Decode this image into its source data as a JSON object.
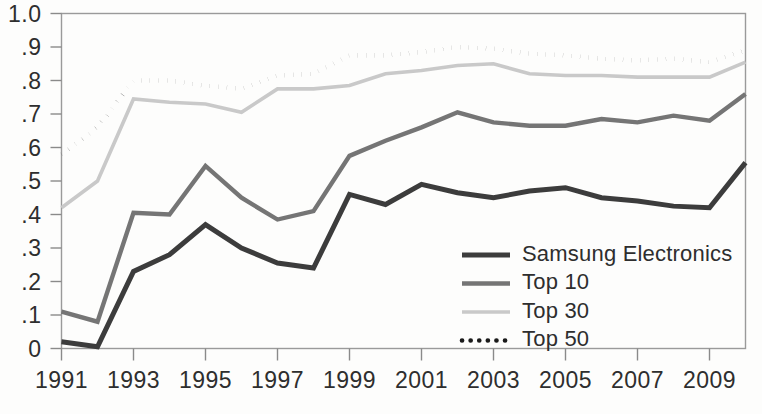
{
  "chart_data": {
    "type": "line",
    "title": "",
    "subtitle": "",
    "xlabel": "",
    "ylabel": "",
    "xlim": [
      1991,
      2010
    ],
    "ylim": [
      0,
      1.0
    ],
    "grid": false,
    "legend_position": "inside-bottom-right",
    "x": [
      1991,
      1992,
      1993,
      1994,
      1995,
      1996,
      1997,
      1998,
      1999,
      2000,
      2001,
      2002,
      2003,
      2004,
      2005,
      2006,
      2007,
      2008,
      2009,
      2010
    ],
    "xtick_values": [
      1991,
      1993,
      1995,
      1997,
      1999,
      2001,
      2003,
      2005,
      2007,
      2009
    ],
    "xtick_labels": [
      "1991",
      "1993",
      "1995",
      "1997",
      "1999",
      "2001",
      "2003",
      "2005",
      "2007",
      "2009"
    ],
    "ytick_values": [
      0,
      0.1,
      0.2,
      0.3,
      0.4,
      0.5,
      0.6,
      0.7,
      0.8,
      0.9,
      1.0
    ],
    "ytick_labels": [
      "0",
      ".1",
      ".2",
      ".3",
      ".4",
      ".5",
      ".6",
      ".7",
      ".8",
      ".9",
      "1.0"
    ],
    "series": [
      {
        "name": "Samsung Electronics",
        "color": "#3c3c3c",
        "width": 5.0,
        "dash": "none",
        "values": [
          0.02,
          0.005,
          0.23,
          0.28,
          0.37,
          0.3,
          0.255,
          0.24,
          0.46,
          0.43,
          0.49,
          0.465,
          0.45,
          0.47,
          0.48,
          0.45,
          0.44,
          0.425,
          0.42,
          0.555
        ]
      },
      {
        "name": "Top 10",
        "color": "#757575",
        "width": 4.4,
        "dash": "none",
        "values": [
          0.11,
          0.08,
          0.405,
          0.4,
          0.545,
          0.45,
          0.385,
          0.41,
          0.575,
          0.62,
          0.66,
          0.705,
          0.675,
          0.665,
          0.665,
          0.685,
          0.675,
          0.695,
          0.68,
          0.76
        ]
      },
      {
        "name": "Top 30",
        "color": "#c9c9c9",
        "width": 3.6,
        "dash": "none",
        "values": [
          0.42,
          0.5,
          0.745,
          0.735,
          0.73,
          0.705,
          0.775,
          0.775,
          0.785,
          0.82,
          0.83,
          0.845,
          0.85,
          0.82,
          0.815,
          0.815,
          0.81,
          0.81,
          0.81,
          0.855
        ]
      },
      {
        "name": "Top 50",
        "color": "#1a1a1a",
        "width": 4.6,
        "dash": "dotted",
        "values": [
          0.58,
          0.66,
          0.8,
          0.8,
          0.785,
          0.775,
          0.815,
          0.82,
          0.875,
          0.875,
          0.885,
          0.9,
          0.895,
          0.88,
          0.875,
          0.865,
          0.86,
          0.865,
          0.855,
          0.89
        ]
      }
    ]
  },
  "legend": {
    "items": [
      {
        "label": "Samsung Electronics"
      },
      {
        "label": "Top 10"
      },
      {
        "label": "Top 30"
      },
      {
        "label": "Top 50"
      }
    ]
  }
}
